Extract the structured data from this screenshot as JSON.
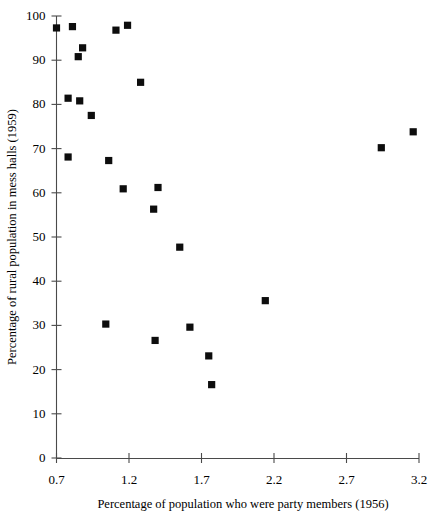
{
  "chart_data": {
    "type": "scatter",
    "title": "",
    "xlabel": "Percentage of population who were party members (1956)",
    "ylabel": "Percentage of rural population in mess halls (1959)",
    "xlim": [
      0.7,
      3.2
    ],
    "ylim": [
      0,
      100
    ],
    "xticks": [
      "0.7",
      "1.2",
      "1.7",
      "2.2",
      "2.7",
      "3.2"
    ],
    "xtick_values": [
      0.7,
      1.2,
      1.7,
      2.2,
      2.7,
      3.2
    ],
    "yticks": [
      "0",
      "10",
      "20",
      "30",
      "40",
      "50",
      "60",
      "70",
      "80",
      "90",
      "100"
    ],
    "ytick_values": [
      0,
      10,
      20,
      30,
      40,
      50,
      60,
      70,
      80,
      90,
      100
    ],
    "grid": false,
    "legend": null,
    "marker": "square",
    "marker_color": "#0d0d0d",
    "series": [
      {
        "name": "provinces",
        "points": [
          {
            "x": 0.7,
            "y": 97.3
          },
          {
            "x": 0.81,
            "y": 97.6
          },
          {
            "x": 0.88,
            "y": 92.8
          },
          {
            "x": 0.85,
            "y": 90.8
          },
          {
            "x": 0.78,
            "y": 81.4
          },
          {
            "x": 0.86,
            "y": 80.8
          },
          {
            "x": 0.94,
            "y": 77.5
          },
          {
            "x": 0.78,
            "y": 68.1
          },
          {
            "x": 1.04,
            "y": 30.3
          },
          {
            "x": 1.06,
            "y": 67.3
          },
          {
            "x": 1.11,
            "y": 96.8
          },
          {
            "x": 1.16,
            "y": 60.9
          },
          {
            "x": 1.19,
            "y": 97.9
          },
          {
            "x": 1.28,
            "y": 85.0
          },
          {
            "x": 1.37,
            "y": 56.3
          },
          {
            "x": 1.38,
            "y": 26.6
          },
          {
            "x": 1.4,
            "y": 61.2
          },
          {
            "x": 1.55,
            "y": 47.7
          },
          {
            "x": 1.62,
            "y": 29.6
          },
          {
            "x": 1.75,
            "y": 23.1
          },
          {
            "x": 1.77,
            "y": 16.6
          },
          {
            "x": 2.14,
            "y": 35.6
          },
          {
            "x": 2.94,
            "y": 70.2
          },
          {
            "x": 3.16,
            "y": 73.8
          }
        ]
      }
    ]
  }
}
